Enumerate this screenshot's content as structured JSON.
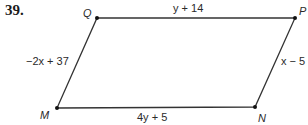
{
  "problem": {
    "number": "39."
  },
  "figure": {
    "type": "parallelogram",
    "stroke_color": "#333333",
    "vertices": {
      "Q": {
        "label": "Q",
        "x": 97,
        "y": 18
      },
      "P": {
        "label": "P",
        "x": 295,
        "y": 18
      },
      "N": {
        "label": "N",
        "x": 255,
        "y": 107
      },
      "M": {
        "label": "M",
        "x": 57,
        "y": 108
      }
    },
    "sides": {
      "QP": {
        "label": "y + 14"
      },
      "PN": {
        "label": "x − 5"
      },
      "MN": {
        "label": "4y + 5"
      },
      "QM": {
        "label": "−2x + 37"
      }
    }
  }
}
